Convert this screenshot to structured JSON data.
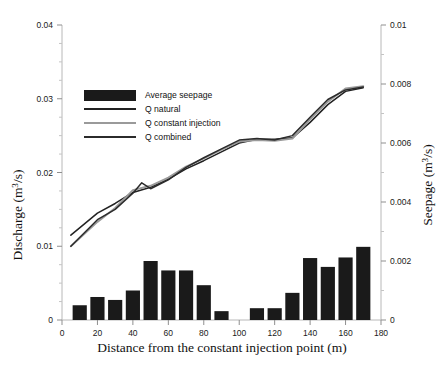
{
  "chart_data": {
    "type": "bar",
    "title": "",
    "xlabel": "Distance from the constant injection point (m)",
    "ylabel": "Discharge (m3/s)",
    "ylabel_right": "Seepage (m3/s)",
    "xlim": [
      0,
      180
    ],
    "ylim": [
      0,
      0.04
    ],
    "ylim_right": [
      0,
      0.01
    ],
    "xticks": [
      0,
      20,
      40,
      60,
      80,
      100,
      120,
      140,
      160,
      180
    ],
    "xtick_labels": [
      "0",
      "20",
      "40",
      "60",
      "80",
      "100",
      "120",
      "140",
      "160",
      "180"
    ],
    "yticks": [
      0,
      0.01,
      0.02,
      0.03,
      0.04
    ],
    "ytick_labels": [
      "0",
      "0.01",
      "0.02",
      "0.03",
      "0.04"
    ],
    "yticks_right": [
      0,
      0.002,
      0.004,
      0.006,
      0.008,
      0.01
    ],
    "ytick_labels_right": [
      "0",
      "0.002",
      "0.004",
      "0.006",
      "0.008",
      "0.01"
    ],
    "yminor_step": 0.0025,
    "grid": false,
    "legend_position": "upper-left-inside",
    "legend": [
      {
        "label": "Average seepage",
        "type": "bar",
        "color": "#1a1a1a"
      },
      {
        "label": "Q natural",
        "type": "line",
        "color": "#222222"
      },
      {
        "label": "Q constant injection",
        "type": "line",
        "color": "#9a9a9a"
      },
      {
        "label": "Q combined",
        "type": "line",
        "color": "#2b2b2b"
      }
    ],
    "bars": {
      "name": "Average seepage",
      "axis": "right",
      "color": "#1a1a1a",
      "width_m": 8,
      "x": [
        10,
        20,
        30,
        40,
        50,
        60,
        70,
        80,
        90,
        110,
        120,
        130,
        140,
        150,
        160,
        170
      ],
      "values": [
        0.0005,
        0.00078,
        0.00068,
        0.001,
        0.002,
        0.00168,
        0.00168,
        0.00118,
        0.0003,
        0.0004,
        0.0004,
        0.00092,
        0.0021,
        0.0018,
        0.00212,
        0.00248
      ]
    },
    "series": [
      {
        "name": "Q natural",
        "axis": "left",
        "color": "#222222",
        "x": [
          5,
          20,
          30,
          40,
          50,
          60,
          70,
          80,
          90,
          100,
          110,
          120,
          130,
          140,
          150,
          160,
          170
        ],
        "values": [
          0.0115,
          0.0145,
          0.0158,
          0.0173,
          0.018,
          0.0191,
          0.0205,
          0.0216,
          0.0228,
          0.024,
          0.0245,
          0.0245,
          0.0247,
          0.0268,
          0.0292,
          0.031,
          0.0315
        ]
      },
      {
        "name": "Q constant injection",
        "axis": "left",
        "color": "#9a9a9a",
        "x": [
          5,
          20,
          30,
          40,
          50,
          60,
          70,
          80,
          90,
          100,
          110,
          120,
          130,
          140,
          150,
          160,
          170
        ],
        "values": [
          0.01,
          0.0133,
          0.0152,
          0.0176,
          0.0182,
          0.0193,
          0.0208,
          0.0219,
          0.0231,
          0.0242,
          0.0244,
          0.0243,
          0.0246,
          0.0272,
          0.0296,
          0.0314,
          0.0317
        ]
      },
      {
        "name": "Q combined",
        "axis": "left",
        "color": "#2b2b2b",
        "x": [
          5,
          20,
          30,
          40,
          45,
          50,
          60,
          70,
          80,
          90,
          100,
          110,
          120,
          130,
          140,
          150,
          160,
          170
        ],
        "values": [
          0.01,
          0.0136,
          0.015,
          0.0172,
          0.0186,
          0.0178,
          0.019,
          0.0207,
          0.022,
          0.0232,
          0.0244,
          0.0246,
          0.0244,
          0.025,
          0.0275,
          0.0299,
          0.0312,
          0.0316
        ]
      }
    ]
  }
}
